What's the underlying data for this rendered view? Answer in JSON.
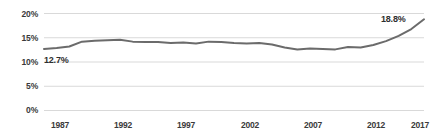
{
  "chart_data": {
    "type": "line",
    "title": "",
    "subtitle": "",
    "xlabel": "",
    "ylabel": "",
    "xlim": [
      1987,
      2017
    ],
    "ylim": [
      0,
      20
    ],
    "grid": true,
    "legend": false,
    "line_color": "#6b6b6b",
    "gridline_color": "#d9d9d9",
    "text_color": "#3a3a3a",
    "y_ticks": [
      "0%",
      "5%",
      "10%",
      "15%",
      "20%"
    ],
    "y_tick_values": [
      0,
      5,
      10,
      15,
      20
    ],
    "x_ticks": [
      "1987",
      "1992",
      "1997",
      "2002",
      "2007",
      "2012",
      "2017"
    ],
    "x_tick_values": [
      1987,
      1992,
      1997,
      2002,
      2007,
      2012,
      2017
    ],
    "x": [
      1987,
      1988,
      1989,
      1990,
      1991,
      1992,
      1993,
      1994,
      1995,
      1996,
      1997,
      1998,
      1999,
      2000,
      2001,
      2002,
      2003,
      2004,
      2005,
      2006,
      2007,
      2008,
      2009,
      2010,
      2011,
      2012,
      2013,
      2014,
      2015,
      2016,
      2017
    ],
    "values": [
      12.7,
      12.9,
      13.2,
      14.2,
      14.4,
      14.5,
      14.6,
      14.2,
      14.1,
      14.1,
      13.9,
      14.0,
      13.8,
      14.2,
      14.1,
      13.9,
      13.8,
      13.9,
      13.6,
      13.0,
      12.6,
      12.8,
      12.7,
      12.6,
      13.1,
      13.0,
      13.5,
      14.3,
      15.4,
      16.8,
      18.8
    ],
    "annotations": [
      {
        "name": "start-value-label",
        "text": "12.7%",
        "x": 1987,
        "y": 12.7,
        "position": "below-right"
      },
      {
        "name": "end-value-label",
        "text": "18.8%",
        "x": 2017,
        "y": 18.8,
        "position": "above-left"
      }
    ]
  }
}
